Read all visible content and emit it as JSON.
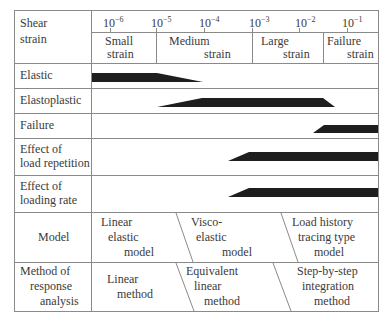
{
  "header": {
    "label_line1": "Shear",
    "label_line2": "strain",
    "ticks": [
      {
        "base": "10",
        "exp": "−6"
      },
      {
        "base": "10",
        "exp": "−5"
      },
      {
        "base": "10",
        "exp": "−4"
      },
      {
        "base": "10",
        "exp": "−3"
      },
      {
        "base": "10",
        "exp": "−2"
      },
      {
        "base": "10",
        "exp": "−1"
      }
    ],
    "ranges": [
      {
        "line1": "Small",
        "line2": "strain"
      },
      {
        "line1": "Medium",
        "line2": "strain"
      },
      {
        "line1": "Large",
        "line2": "strain"
      },
      {
        "line1": "Failure",
        "line2": "strain"
      }
    ]
  },
  "rows": [
    {
      "line1": "Elastic",
      "line2": ""
    },
    {
      "line1": "Elastoplastic",
      "line2": ""
    },
    {
      "line1": "Failure",
      "line2": ""
    },
    {
      "line1": "Effect of",
      "line2": "load repetition"
    },
    {
      "line1": "Effect of",
      "line2": "loading rate"
    }
  ],
  "model": {
    "label": "Model",
    "items": [
      {
        "l1": "Linear",
        "l2": "elastic",
        "l3": "model"
      },
      {
        "l1": "Visco-",
        "l2": "elastic",
        "l3": "model"
      },
      {
        "l1": "Load history",
        "l2": "tracing type",
        "l3": "model"
      }
    ]
  },
  "method": {
    "label_l1": "Method of",
    "label_l2": "response",
    "label_l3": "analysis",
    "items": [
      {
        "l1": "Linear",
        "l2": "method",
        "l3": ""
      },
      {
        "l1": "Equivalent",
        "l2": "linear",
        "l3": "method"
      },
      {
        "l1": "Step-by-step",
        "l2": "integration",
        "l3": "method"
      }
    ]
  },
  "colors": {
    "grid": "#8a8a8a",
    "bar": "#1e1e1e",
    "text": "#3a3a3a"
  }
}
